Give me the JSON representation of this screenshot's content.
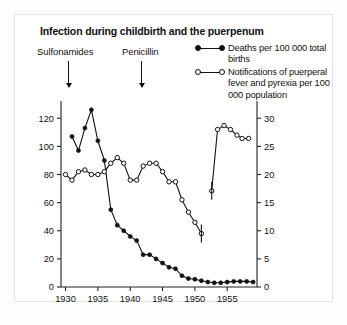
{
  "figure": {
    "title": "Infection during childbirth and the puerpenum",
    "background": "#ffffff",
    "border_color": "#e2e2e2"
  },
  "annotations": [
    {
      "name": "sulfonamides",
      "label": "Sulfonamides",
      "year": 1935.6,
      "arrow": "down-arrow"
    },
    {
      "name": "penicillin",
      "label": "Penicillin",
      "year": 1943.7,
      "arrow": "down-arrow"
    }
  ],
  "legend": {
    "position": "top-right",
    "entries": [
      {
        "marker": "filled-circle",
        "label": "Deaths per 100 000 total births"
      },
      {
        "marker": "open-circle",
        "label": "Notifications of puerperal fever and pyrexia per 100 000 population"
      }
    ]
  },
  "axes": {
    "x": {
      "label": "",
      "ticks": [
        1930,
        1935,
        1940,
        1945,
        1950,
        1955
      ],
      "tick_labels": [
        "1930",
        "1935",
        "1940",
        "1945",
        "1950",
        "1955"
      ],
      "min": 1929.3,
      "max": 1959.6
    },
    "y_left": {
      "label": "",
      "ticks": [
        0,
        20,
        40,
        60,
        80,
        100,
        120
      ],
      "tick_labels": [
        "0",
        "20",
        "40",
        "60",
        "80",
        "100",
        "120"
      ],
      "min": 0,
      "max": 128
    },
    "y_right": {
      "label": "",
      "ticks": [
        0,
        5,
        10,
        15,
        20,
        25,
        30
      ],
      "tick_labels": [
        "0",
        "5",
        "10",
        "15",
        "20",
        "25",
        "30"
      ],
      "min": 0,
      "max": 32
    }
  },
  "chart_data": {
    "type": "line",
    "title": "Infection during childbirth and the puerpenum",
    "xlabel": "",
    "ylabel": "Deaths per 100 000 total births",
    "ylabel_right": "Notifications of puerperal fever and pyrexia per 100 000 population",
    "xlim": [
      1929.3,
      1959.6
    ],
    "ylim": [
      0,
      128
    ],
    "ylim_right": [
      0,
      32
    ],
    "grid": false,
    "legend_position": "top-right",
    "series": [
      {
        "name": "Deaths per 100 000 total births",
        "axis": "left",
        "marker": "filled-circle",
        "x": [
          1931,
          1932,
          1933,
          1934,
          1935,
          1936,
          1937,
          1938,
          1939,
          1940,
          1941,
          1942,
          1943,
          1944,
          1945,
          1946,
          1947,
          1948,
          1949,
          1950,
          1951,
          1952,
          1953,
          1954,
          1955,
          1956,
          1957,
          1958,
          1959
        ],
        "values": [
          107,
          97,
          113,
          126,
          104,
          90,
          55,
          44,
          40,
          36,
          33,
          23,
          23,
          20,
          17,
          14,
          13,
          8,
          6,
          5.5,
          4.5,
          3.5,
          3,
          3,
          3.5,
          4,
          4,
          4,
          3.5
        ]
      },
      {
        "name": "Notifications of puerperal fever and pyrexia per 100 000 population",
        "axis": "right",
        "marker": "open-circle",
        "segments": [
          {
            "x": [
              1930,
              1931,
              1932,
              1933,
              1934,
              1935,
              1936,
              1937,
              1938,
              1939,
              1940,
              1941,
              1942,
              1943,
              1944,
              1945,
              1946,
              1947,
              1948,
              1949,
              1950,
              1951
            ],
            "values": [
              20,
              19,
              20.5,
              20.8,
              20,
              20,
              20.5,
              22,
              23,
              22,
              19,
              19,
              21.5,
              22,
              22,
              20.5,
              18.7,
              18.7,
              15.5,
              13.3,
              11.5,
              9.5
            ]
          },
          {
            "x": [
              1952.6,
              1953.5,
              1954.5,
              1955.5,
              1956.5,
              1957.3,
              1958.3
            ],
            "values": [
              17.1,
              28,
              28.7,
              28,
              27,
              26.4,
              26.4
            ]
          }
        ],
        "discontinuity_note": "series break between 1951 and 1952.6 marked by vertical bars"
      }
    ]
  }
}
